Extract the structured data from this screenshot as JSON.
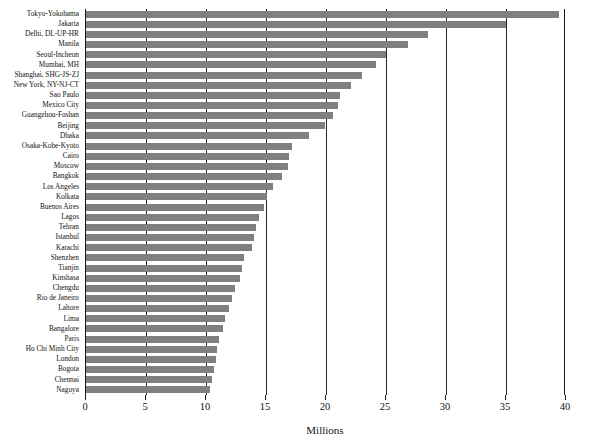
{
  "chart_data": {
    "type": "bar",
    "orientation": "horizontal",
    "title": "",
    "xlabel": "Millions",
    "ylabel": "",
    "xlim": [
      0,
      40
    ],
    "xticks": [
      0,
      5,
      10,
      15,
      20,
      25,
      30,
      35,
      40
    ],
    "xtick_labels": [
      "0",
      "5",
      "10",
      "15",
      "20",
      "25",
      "30",
      "35",
      "40"
    ],
    "grid": true,
    "grid_axis": "x",
    "legend": false,
    "bar_color": "#808080",
    "categories": [
      "Tokyo-Yokohama",
      "Jakarta",
      "Delhi, DL-UP-HR",
      "Manila",
      "Seoul-Incheon",
      "Mumbai, MH",
      "Shanghai, SHG-JS-ZJ",
      "New York, NY-NJ-CT",
      "Sao Paulo",
      "Mexico City",
      "Guangzhou-Foshan",
      "Beijing",
      "Dhaka",
      "Osaka-Kobe-Kyoto",
      "Cairo",
      "Moscow",
      "Bangkok",
      "Los Angeles",
      "Kolkata",
      "Buenos Aires",
      "Lagos",
      "Tehran",
      "Istanbul",
      "Karachi",
      "Shenzhen",
      "Tianjin",
      "Kinshasa",
      "Chengdu",
      "Rio de Janeiro",
      "Lahore",
      "Lima",
      "Bangalore",
      "Paris",
      "Ho Chi Minh City",
      "London",
      "Bogota",
      "Chennai",
      "Nagoya"
    ],
    "values": [
      39.4,
      35.0,
      28.5,
      26.8,
      25.0,
      24.2,
      23.0,
      22.1,
      21.2,
      21.0,
      20.6,
      19.9,
      18.6,
      17.2,
      16.9,
      16.8,
      16.3,
      15.6,
      15.1,
      14.8,
      14.4,
      14.2,
      14.0,
      13.8,
      13.2,
      13.0,
      12.8,
      12.4,
      12.2,
      11.9,
      11.6,
      11.4,
      11.1,
      10.9,
      10.8,
      10.7,
      10.5,
      10.3
    ]
  }
}
